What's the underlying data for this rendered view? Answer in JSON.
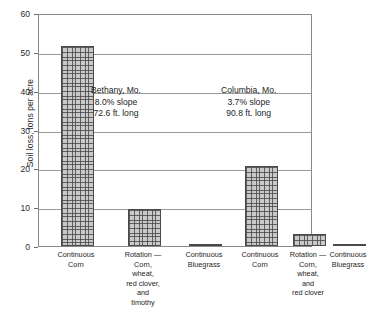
{
  "chart_data": {
    "type": "bar",
    "title": "",
    "xlabel": "",
    "ylabel": "Soil loss, tons per acre",
    "ylim": [
      0,
      60
    ],
    "yticks": [
      0,
      10,
      20,
      30,
      40,
      50,
      60
    ],
    "ytick_labels": [
      "0",
      "10",
      "20",
      "30",
      "40",
      "50",
      "60"
    ],
    "grid": true,
    "legend": "none",
    "categories": [
      "Continuous Corn",
      "Rotation — Corn, wheat, red clover, and timothy",
      "Continuous Bluegrass",
      "Continuous Corn",
      "Rotation — Corn, wheat, and red clover",
      "Continuous Bluegrass"
    ],
    "values": [
      51.4,
      9.6,
      0.3,
      20.6,
      3.0,
      0.3
    ],
    "groups": [
      {
        "name": "Bethany, Mo.",
        "categories": [
          "Continuous Corn",
          "Rotation — Corn, wheat, red clover, and timothy",
          "Continuous Bluegrass"
        ],
        "values": [
          51.4,
          9.6,
          0.3
        ]
      },
      {
        "name": "Columbia, Mo.",
        "categories": [
          "Continuous Corn",
          "Rotation — Corn, wheat, and red clover",
          "Continuous Bluegrass"
        ],
        "values": [
          20.6,
          3.0,
          0.3
        ]
      }
    ],
    "annotations": [
      {
        "lines": [
          "Bethany, Mo.",
          "8.0% slope",
          "72.6 ft. long"
        ]
      },
      {
        "lines": [
          "Columbia, Mo.",
          "3.7% slope",
          "90.8 ft. long"
        ]
      }
    ]
  },
  "axis": {
    "y_title": "Soil loss, tons per acre",
    "y_tick_labels": [
      "60",
      "50",
      "40",
      "30",
      "20",
      "10",
      "0"
    ]
  },
  "annotations": {
    "bethany": {
      "line1": "Bethany, Mo.",
      "line2": "8.0% slope",
      "line3": "72.6 ft. long"
    },
    "columbia": {
      "line1": "Columbia, Mo.",
      "line2": "3.7% slope",
      "line3": "90.8 ft. long"
    }
  },
  "x_labels": [
    {
      "l1": "Continuous",
      "l2": "Corn",
      "l3": "",
      "l4": "",
      "l5": "",
      "l6": ""
    },
    {
      "l1": "Rotation —",
      "l2": "Corn,",
      "l3": "wheat,",
      "l4": "red clover,",
      "l5": "and",
      "l6": "timothy"
    },
    {
      "l1": "Continuous",
      "l2": "Bluegrass",
      "l3": "",
      "l4": "",
      "l5": "",
      "l6": ""
    },
    {
      "l1": "Continuous",
      "l2": "Corn",
      "l3": "",
      "l4": "",
      "l5": "",
      "l6": ""
    },
    {
      "l1": "Rotation —",
      "l2": "Corn,",
      "l3": "wheat,",
      "l4": "and",
      "l5": "red clover",
      "l6": ""
    },
    {
      "l1": "Continuous",
      "l2": "Bluegrass",
      "l3": "",
      "l4": "",
      "l5": "",
      "l6": ""
    }
  ],
  "colors": {
    "frame": "#8a8a8a",
    "gridline": "#9a9a9a",
    "bar_fill": "#c9c9c9",
    "bar_edge": "#4a4a4a",
    "text": "#1d1d1d"
  }
}
